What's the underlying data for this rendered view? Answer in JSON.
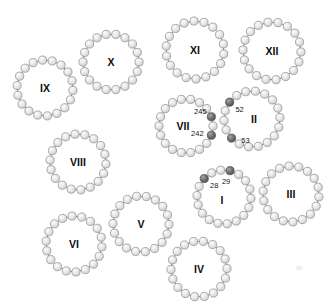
{
  "figure": {
    "width": 333,
    "height": 307,
    "background_color": "#ffffff",
    "bead_fill_light": "#e3e3e3",
    "bead_fill_dark": "#6b6b6b",
    "bead_stroke": "#8c8c8c",
    "link_stroke": "#6e6e6e",
    "label_color": "#0d0d0d",
    "bead_radius": 4.1,
    "dark_bead_radius": 4.1
  },
  "rings": [
    {
      "id": "ring-ix",
      "label": "IX",
      "cx": 45,
      "cy": 88,
      "radius": 28,
      "bead_count": 18,
      "start_angle": -95,
      "label_dx": 0,
      "label_dy": 0,
      "label_font_size": 10.5,
      "highlights": []
    },
    {
      "id": "ring-x",
      "label": "X",
      "cx": 111,
      "cy": 62,
      "radius": 28,
      "bead_count": 18,
      "start_angle": -100,
      "label_dx": 0,
      "label_dy": 0,
      "label_font_size": 10.5,
      "highlights": []
    },
    {
      "id": "ring-xi",
      "label": "XI",
      "cx": 195,
      "cy": 50,
      "radius": 29,
      "bead_count": 18,
      "start_angle": -92,
      "label_dx": 0,
      "label_dy": 0,
      "label_font_size": 10.5,
      "highlights": []
    },
    {
      "id": "ring-xii",
      "label": "XII",
      "cx": 272,
      "cy": 51,
      "radius": 29,
      "bead_count": 18,
      "start_angle": -98,
      "label_dx": 0,
      "label_dy": 0,
      "label_font_size": 10.5,
      "highlights": []
    },
    {
      "id": "ring-vii",
      "label": "VII",
      "cx": 186,
      "cy": 126,
      "radius": 27,
      "bead_count": 18,
      "start_angle": -100,
      "label_dx": -3,
      "label_dy": 0,
      "label_font_size": 10.5,
      "highlights": [
        {
          "index": 4,
          "value": "245",
          "text_dx": -11,
          "text_dy": -5
        },
        {
          "index": 6,
          "value": "242",
          "text_dx": -14,
          "text_dy": -2
        }
      ]
    },
    {
      "id": "ring-ii",
      "label": "II",
      "cx": 252,
      "cy": 119,
      "radius": 28,
      "bead_count": 18,
      "start_angle": -103,
      "label_dx": 2,
      "label_dy": 0,
      "label_font_size": 10.5,
      "highlights": [
        {
          "index": 16,
          "value": "52",
          "text_dx": 10,
          "text_dy": 7
        },
        {
          "index": 12,
          "value": "53",
          "text_dx": 14,
          "text_dy": 2
        }
      ]
    },
    {
      "id": "ring-viii",
      "label": "VIII",
      "cx": 78,
      "cy": 162,
      "radius": 28,
      "bead_count": 18,
      "start_angle": -96,
      "label_dx": 0,
      "label_dy": 0,
      "label_font_size": 10.5,
      "highlights": []
    },
    {
      "id": "ring-i",
      "label": "I",
      "cx": 224,
      "cy": 197,
      "radius": 27,
      "bead_count": 18,
      "start_angle": -97,
      "label_dx": -2,
      "label_dy": 3,
      "label_font_size": 10.5,
      "highlights": [
        {
          "index": 16,
          "value": "28",
          "text_dx": 10,
          "text_dy": 7
        },
        {
          "index": 1,
          "value": "29",
          "text_dx": -4,
          "text_dy": 11
        }
      ]
    },
    {
      "id": "ring-iii",
      "label": "III",
      "cx": 291,
      "cy": 194,
      "radius": 28,
      "bead_count": 18,
      "start_angle": -94,
      "label_dx": 0,
      "label_dy": 0,
      "label_font_size": 10.5,
      "highlights": []
    },
    {
      "id": "ring-v",
      "label": "V",
      "cx": 141,
      "cy": 224,
      "radius": 28,
      "bead_count": 18,
      "start_angle": -99,
      "label_dx": 0,
      "label_dy": 0,
      "label_font_size": 10.5,
      "highlights": []
    },
    {
      "id": "ring-vi",
      "label": "VI",
      "cx": 74,
      "cy": 244,
      "radius": 28,
      "bead_count": 18,
      "start_angle": -94,
      "label_dx": 0,
      "label_dy": 0,
      "label_font_size": 10.5,
      "highlights": []
    },
    {
      "id": "ring-iv",
      "label": "IV",
      "cx": 199,
      "cy": 269,
      "radius": 28,
      "bead_count": 18,
      "start_angle": -101,
      "label_dx": 0,
      "label_dy": 0,
      "label_font_size": 10.5,
      "highlights": []
    }
  ],
  "artifacts": [
    {
      "id": "corner-smudge",
      "cx": 299,
      "cy": 268,
      "rx": 3.5,
      "ry": 2.2
    }
  ]
}
